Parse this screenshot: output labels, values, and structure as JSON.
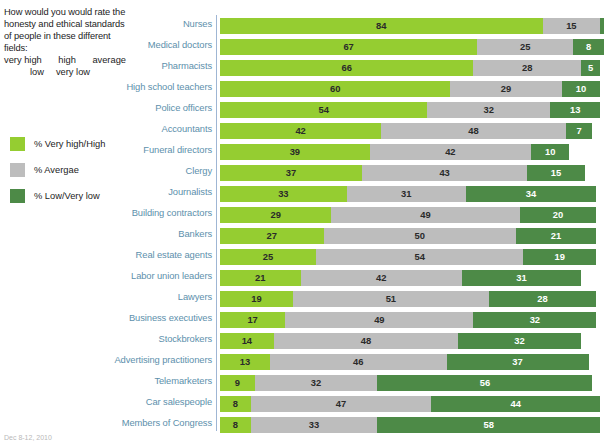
{
  "intro": {
    "question": "How would you would rate the honesty and ethical standards of people in these different fields:",
    "scale_top_left": "very high",
    "scale_top_mid": "high",
    "scale_top_right": "average",
    "scale_bottom_left": "low",
    "scale_bottom_right": "very low"
  },
  "legend": {
    "items": [
      {
        "label": "% Very high/High",
        "color": "#95cd31",
        "name": "legend-very-high"
      },
      {
        "label": "% Avergae",
        "color": "#bdbdbd",
        "name": "legend-average"
      },
      {
        "label": "% Low/Very low",
        "color": "#4d8a47",
        "name": "legend-low"
      }
    ]
  },
  "footnote": "Dec 8-12, 2010",
  "colors": {
    "very_high_high": "#95cd31",
    "average": "#bdbdbd",
    "low_very_low": "#4d8a47",
    "label_text": "#5d90ac",
    "axis": "#9fb6d4"
  },
  "chart_data": {
    "type": "bar",
    "orientation": "horizontal",
    "stacked": true,
    "title": "How would you would rate the honesty and ethical standards of people in these different fields:",
    "xlabel": "",
    "ylabel": "",
    "xlim": [
      0,
      100
    ],
    "grid": false,
    "legend_position": "left",
    "categories": [
      "Nurses",
      "Medical doctors",
      "Pharmacists",
      "High school teachers",
      "Police officers",
      "Accountants",
      "Funeral directors",
      "Clergy",
      "Journalists",
      "Building contractors",
      "Bankers",
      "Real estate agents",
      "Labor union leaders",
      "Lawyers",
      "Business executives",
      "Stockbrokers",
      "Advertising practitioners",
      "Telemarketers",
      "Car salespeople",
      "Members of Congress"
    ],
    "series": [
      {
        "name": "% Very high/High",
        "color": "#95cd31",
        "values": [
          84,
          67,
          66,
          60,
          54,
          42,
          39,
          37,
          33,
          29,
          27,
          25,
          21,
          19,
          17,
          14,
          13,
          9,
          8,
          8
        ]
      },
      {
        "name": "% Avergae",
        "color": "#bdbdbd",
        "values": [
          15,
          25,
          28,
          29,
          32,
          48,
          42,
          43,
          31,
          49,
          50,
          54,
          42,
          51,
          49,
          48,
          46,
          32,
          47,
          33
        ]
      },
      {
        "name": "% Low/Very low",
        "color": "#4d8a47",
        "values": [
          1,
          8,
          5,
          10,
          13,
          7,
          10,
          15,
          34,
          20,
          21,
          19,
          31,
          28,
          32,
          32,
          37,
          56,
          44,
          58
        ]
      }
    ],
    "value_labels": {
      "hidden": [
        {
          "row": 0,
          "series": 2
        }
      ]
    }
  }
}
